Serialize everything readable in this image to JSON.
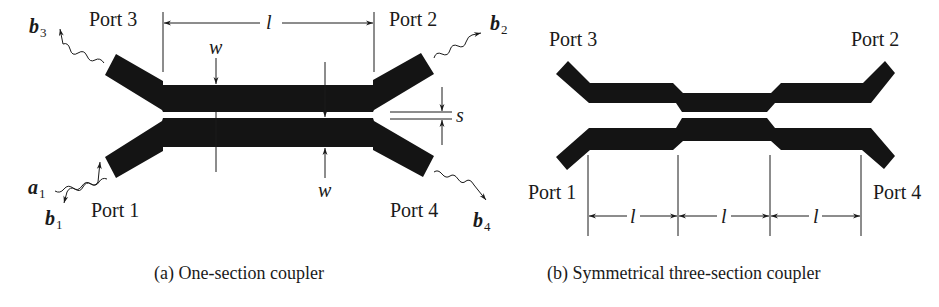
{
  "figure_a": {
    "caption": "(a)  One-section coupler",
    "ports": {
      "port1": "Port 1",
      "port2": "Port 2",
      "port3": "Port 3",
      "port4": "Port 4"
    },
    "waves": {
      "a1": {
        "symbol": "a",
        "sub": "1"
      },
      "b1": {
        "symbol": "b",
        "sub": "1"
      },
      "b2": {
        "symbol": "b",
        "sub": "2"
      },
      "b3": {
        "symbol": "b",
        "sub": "3"
      },
      "b4": {
        "symbol": "b",
        "sub": "4"
      }
    },
    "dimensions": {
      "length": "l",
      "width_top": "w",
      "width_bottom": "w",
      "spacing": "s"
    }
  },
  "figure_b": {
    "caption": "(b)  Symmetrical three-section coupler",
    "ports": {
      "port1": "Port 1",
      "port2": "Port 2",
      "port3": "Port 3",
      "port4": "Port 4"
    },
    "dimensions": {
      "section_lengths": [
        "l",
        "l",
        "l"
      ]
    }
  },
  "colors": {
    "strip": "#141414",
    "line": "#1a1a1a",
    "background": "#ffffff"
  }
}
